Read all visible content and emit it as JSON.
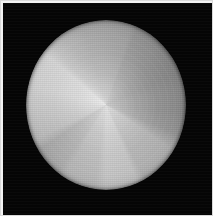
{
  "image": {
    "title": "Radial sector phantom (grayscale)",
    "width_px": 213,
    "height_px": 216,
    "background_color": "#050505",
    "frame_color": "#d9d9d9",
    "modality_note": "grayscale intensity map"
  },
  "chart_data": {
    "type": "pie",
    "subtitle": "",
    "xlabel": "",
    "ylabel": "",
    "legend_position": "none",
    "grid": false,
    "center_x_px": 106,
    "center_y_px": 105,
    "radius_x_px": 80,
    "radius_y_px": 85,
    "background_color": "#050505",
    "center_intensity": 232,
    "rim_intensity": 120,
    "categories": [
      "sector-1",
      "sector-2",
      "sector-3",
      "sector-4",
      "sector-5",
      "sector-6",
      "sector-7",
      "sector-8",
      "sector-9",
      "sector-10",
      "sector-11",
      "sector-12"
    ],
    "values": [
      22,
      30,
      26,
      34,
      40,
      28,
      30,
      26,
      36,
      38,
      44,
      36
    ],
    "start_angles_deg": [
      0,
      22,
      52,
      78,
      112,
      152,
      180,
      210,
      236,
      272,
      310,
      330
    ],
    "end_angles_deg": [
      22,
      52,
      78,
      112,
      152,
      180,
      210,
      236,
      272,
      310,
      330,
      360
    ],
    "gray_levels": [
      150,
      132,
      122,
      128,
      168,
      188,
      176,
      160,
      196,
      208,
      176,
      158
    ],
    "sector_colors": [
      "#969696",
      "#848484",
      "#7a7a7a",
      "#808080",
      "#a8a8a8",
      "#bcbcbc",
      "#b0b0b0",
      "#a0a0a0",
      "#c4c4c4",
      "#d0d0d0",
      "#b0b0b0",
      "#9e9e9e"
    ],
    "conic_gradient": "from 0deg at 50% 50%, #9e9e9e 0deg, #969696 18deg, #8d8d8d 22deg, #848484 40deg, #7e7e7e 52deg, #7a7a7a 66deg, #7e7e7e 78deg, #808080 96deg, #8a8a8a 112deg, #a8a8a8 124deg, #ababab 152deg, #bcbcbc 158deg, #c0c0c0 180deg, #b4b4b4 188deg, #b0b0b0 210deg, #a6a6a6 216deg, #a0a0a0 236deg, #b4b4b4 244deg, #c4c4c4 272deg, #cccccc 284deg, #d0d0d0 310deg, #bebebe 318deg, #b0b0b0 330deg, #a4a4a4 344deg, #9e9e9e 360deg",
    "radial_gradient": "circle at 50% 50%, rgba(255,255,255,0.60) 0%, rgba(255,255,255,0.46) 12%, rgba(255,255,255,0.30) 26%, rgba(255,255,255,0.16) 44%, rgba(255,255,255,0.06) 66%, rgba(255,255,255,0.00) 88%",
    "vignette_gradient": "circle at 50% 50%, rgba(0,0,0,0.00) 0%, rgba(0,0,0,0.00) 62%, rgba(0,0,0,0.10) 80%, rgba(0,0,0,0.26) 93%, rgba(0,0,0,0.55) 100%"
  }
}
